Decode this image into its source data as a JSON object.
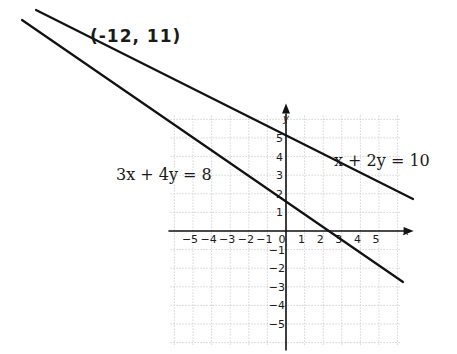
{
  "chart_data": {
    "type": "line",
    "title": "",
    "xlabel": "x",
    "ylabel": "y",
    "xlim": [
      -6,
      6
    ],
    "ylim": [
      -6,
      6
    ],
    "grid": true,
    "x_ticks": [
      "−5",
      "−4",
      "−3",
      "−2",
      "−1",
      "0",
      "1",
      "2",
      "3",
      "4",
      "5"
    ],
    "y_ticks_positive": [
      "1",
      "2",
      "3",
      "4",
      "5"
    ],
    "y_ticks_negative": [
      "−1",
      "−2",
      "−3",
      "−4",
      "−5"
    ],
    "series": [
      {
        "name": "x + 2y = 10",
        "equation": "x + 2y = 10",
        "slope": -0.5,
        "y_intercept": 5,
        "x_intercept": 10,
        "points": [
          [
            -12,
            11
          ],
          [
            0,
            5
          ],
          [
            2,
            4
          ],
          [
            4,
            3
          ],
          [
            6,
            2
          ]
        ]
      },
      {
        "name": "3x + 4y = 8",
        "equation": "3x + 4y = 8",
        "slope": -0.75,
        "y_intercept": 2,
        "x_intercept": 2.67,
        "points": [
          [
            -12,
            11
          ],
          [
            0,
            2
          ],
          [
            2.67,
            0
          ],
          [
            4,
            -1
          ],
          [
            6,
            -2.5
          ]
        ]
      }
    ],
    "annotations": [
      {
        "text": "(-12, 11)",
        "x": -12,
        "y": 11,
        "style": "handwritten",
        "note": "intersection point"
      },
      {
        "text": "x + 2y = 10",
        "target": "series.0"
      },
      {
        "text": "3x + 4y = 8",
        "target": "series.1"
      }
    ],
    "intersection": {
      "x": -12,
      "y": 11
    }
  },
  "labels": {
    "intersection": "(-12, 11)",
    "line1": "x + 2y = 10",
    "line2": "3x + 4y = 8",
    "x_axis": "x",
    "y_axis": "y",
    "origin": "0"
  }
}
